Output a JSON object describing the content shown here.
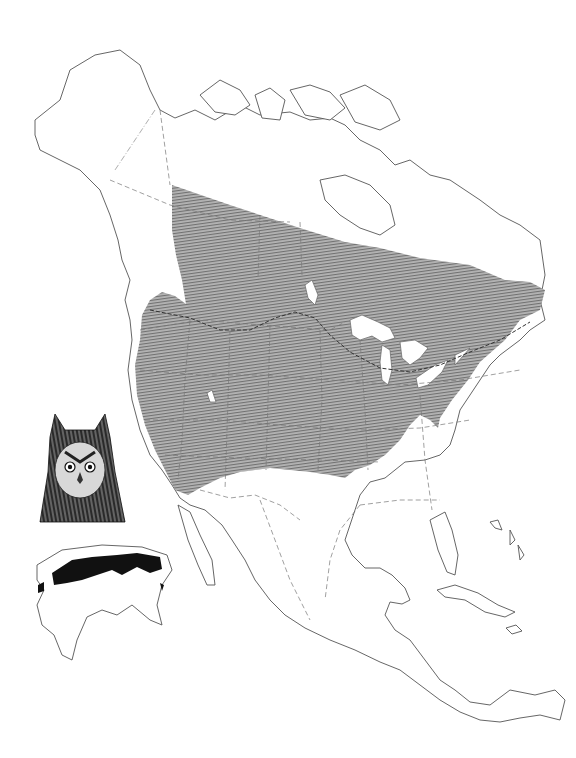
{
  "map": {
    "subject": "Long-eared Owl range map",
    "region": "North America",
    "colors": {
      "background": "#ffffff",
      "outline": "#555555",
      "range_fill": "#9a9a9a",
      "inset_range": "#111111"
    },
    "layers": [
      {
        "name": "year-round-range",
        "style": "hatched gray"
      },
      {
        "name": "winter-boundary-line",
        "style": "dashed dark line"
      },
      {
        "name": "political-borders",
        "style": "dashed gray"
      }
    ],
    "insets": [
      {
        "name": "owl-head-illustration"
      },
      {
        "name": "old-world-range-inset",
        "region": "Eurasia and Africa"
      }
    ]
  }
}
